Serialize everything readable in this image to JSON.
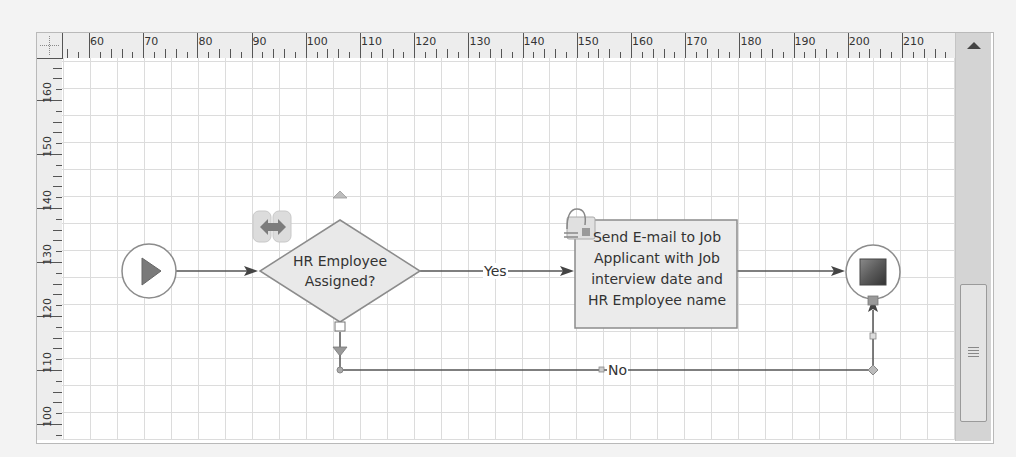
{
  "ruler": {
    "horizontal_labels": [
      "60",
      "70",
      "80",
      "90",
      "100",
      "110",
      "120",
      "130",
      "140",
      "150",
      "160",
      "170",
      "180",
      "190",
      "200",
      "210",
      "2"
    ],
    "vertical_labels": [
      "160",
      "150",
      "140",
      "130",
      "120",
      "110",
      "100"
    ]
  },
  "diagram": {
    "start_event": {
      "icon": "play-triangle-icon"
    },
    "decision": {
      "label_line1": "HR Employee",
      "label_line2": "Assigned?",
      "badge_icon": "data-exchange-icon"
    },
    "task": {
      "line1": "Send E-mail to Job",
      "line2": "Applicant with Job",
      "line3": "interview date and",
      "line4": "HR Employee name",
      "badge_icon": "attachment-mail-icon"
    },
    "end_event": {
      "icon": "stop-square-icon"
    },
    "connectors": {
      "yes_label": "Yes",
      "no_label": "No"
    }
  },
  "colors": {
    "shape_fill": "#e9e9e9",
    "shape_border": "#8c8c8c",
    "line": "#555555",
    "grid": "#dcdcdc"
  }
}
